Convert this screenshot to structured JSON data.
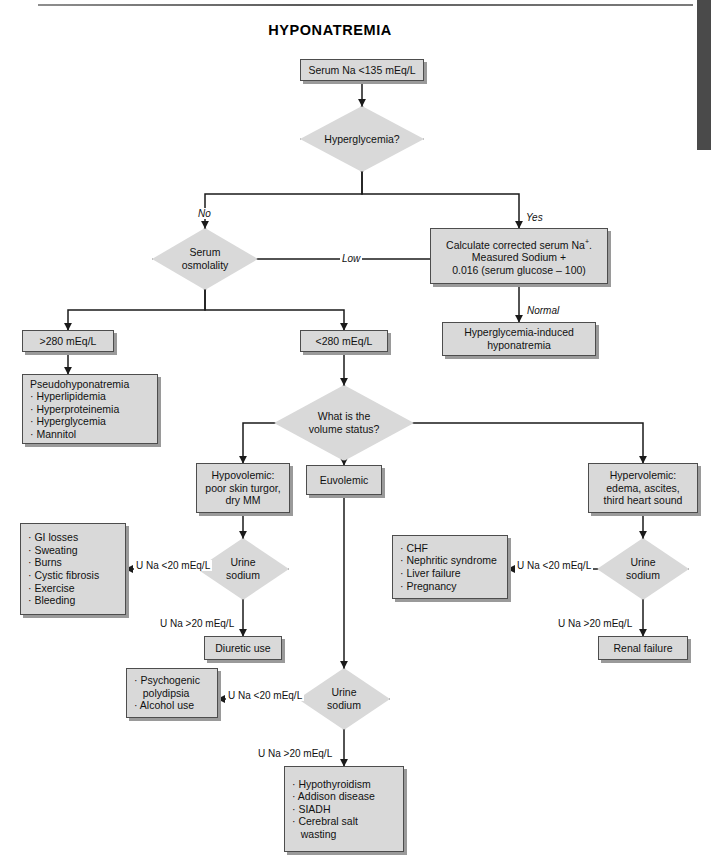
{
  "page": {
    "title": "HYPONATREMIA",
    "colors": {
      "box_fill": "#d9d9d9",
      "box_stroke": "#4d4d4d",
      "shadow": "#9a9a9a",
      "line": "#1a1a1a",
      "edge_tab": "#4a4a4a",
      "text": "#111111"
    }
  },
  "chart_data": {
    "type": "diagram",
    "title": "HYPONATREMIA",
    "diagram_kind": "clinical-decision-flowchart",
    "nodes": [
      {
        "id": "start",
        "shape": "box",
        "lines": [
          "Serum Na <135 mEq/L"
        ]
      },
      {
        "id": "hyperglycemia",
        "shape": "diamond",
        "lines": [
          "Hyperglycemia?"
        ]
      },
      {
        "id": "calc",
        "shape": "box",
        "lines": [
          "Calculate corrected serum Na⁺.",
          "Measured Sodium +",
          "0.016 (serum glucose – 100)"
        ]
      },
      {
        "id": "hgInduced",
        "shape": "box",
        "lines": [
          "Hyperglycemia-induced",
          "hyponatremia"
        ]
      },
      {
        "id": "osmolality",
        "shape": "diamond",
        "lines": [
          "Serum",
          "osmolality"
        ]
      },
      {
        "id": "gt280",
        "shape": "box",
        "lines": [
          ">280 mEq/L"
        ]
      },
      {
        "id": "lt280",
        "shape": "box",
        "lines": [
          "<280 mEq/L"
        ]
      },
      {
        "id": "pseudo",
        "shape": "list",
        "header": "Pseudohyponatremia",
        "items": [
          "Hyperlipidemia",
          "Hyperproteinemia",
          "Hyperglycemia",
          "Mannitol"
        ]
      },
      {
        "id": "volume",
        "shape": "diamond",
        "lines": [
          "What is the",
          "volume status?"
        ]
      },
      {
        "id": "hypovolemic",
        "shape": "box",
        "lines": [
          "Hypovolemic:",
          "poor skin turgor,",
          "dry MM"
        ]
      },
      {
        "id": "euvolemic",
        "shape": "box",
        "lines": [
          "Euvolemic"
        ]
      },
      {
        "id": "hypervolemic",
        "shape": "box",
        "lines": [
          "Hypervolemic:",
          "edema, ascites,",
          "third heart sound"
        ]
      },
      {
        "id": "urineLeft",
        "shape": "diamond",
        "lines": [
          "Urine",
          "sodium"
        ]
      },
      {
        "id": "urineMid",
        "shape": "diamond",
        "lines": [
          "Urine",
          "sodium"
        ]
      },
      {
        "id": "urineRight",
        "shape": "diamond",
        "lines": [
          "Urine",
          "sodium"
        ]
      },
      {
        "id": "hypoLowList",
        "shape": "list",
        "items": [
          "GI losses",
          "Sweating",
          "Burns",
          "Cystic fibrosis",
          "Exercise",
          "Bleeding"
        ]
      },
      {
        "id": "diuretic",
        "shape": "box",
        "lines": [
          "Diuretic use"
        ]
      },
      {
        "id": "hyperLowList",
        "shape": "list",
        "items": [
          "CHF",
          "Nephritic syndrome",
          "Liver failure",
          "Pregnancy"
        ]
      },
      {
        "id": "renalFailure",
        "shape": "box",
        "lines": [
          "Renal failure"
        ]
      },
      {
        "id": "euvoLowList",
        "shape": "list",
        "items": [
          "Psychogenic",
          "polydipsia",
          "Alcohol use"
        ],
        "bullet_on": [
          0,
          2
        ]
      },
      {
        "id": "euvoHighList",
        "shape": "list",
        "items": [
          "Hypothyroidism",
          "Addison disease",
          "SIADH",
          "Cerebral salt",
          "wasting"
        ],
        "bullet_on": [
          0,
          1,
          2,
          3
        ]
      }
    ],
    "edge_labels": [
      {
        "id": "no",
        "text": "No",
        "italic": true
      },
      {
        "id": "yes",
        "text": "Yes",
        "italic": true
      },
      {
        "id": "low",
        "text": "Low",
        "italic": true
      },
      {
        "id": "normal",
        "text": "Normal",
        "italic": true
      },
      {
        "id": "uNaLow1",
        "text": "U Na <20 mEq/L",
        "italic": false
      },
      {
        "id": "uNaHigh1",
        "text": "U Na >20 mEq/L",
        "italic": false
      },
      {
        "id": "uNaLow2",
        "text": "U Na <20 mEq/L",
        "italic": false
      },
      {
        "id": "uNaHigh2",
        "text": "U Na >20 mEq/L",
        "italic": false
      },
      {
        "id": "uNaLow3",
        "text": "U Na <20 mEq/L",
        "italic": false
      },
      {
        "id": "uNaHigh3",
        "text": "U Na >20 mEq/L",
        "italic": false
      }
    ]
  }
}
